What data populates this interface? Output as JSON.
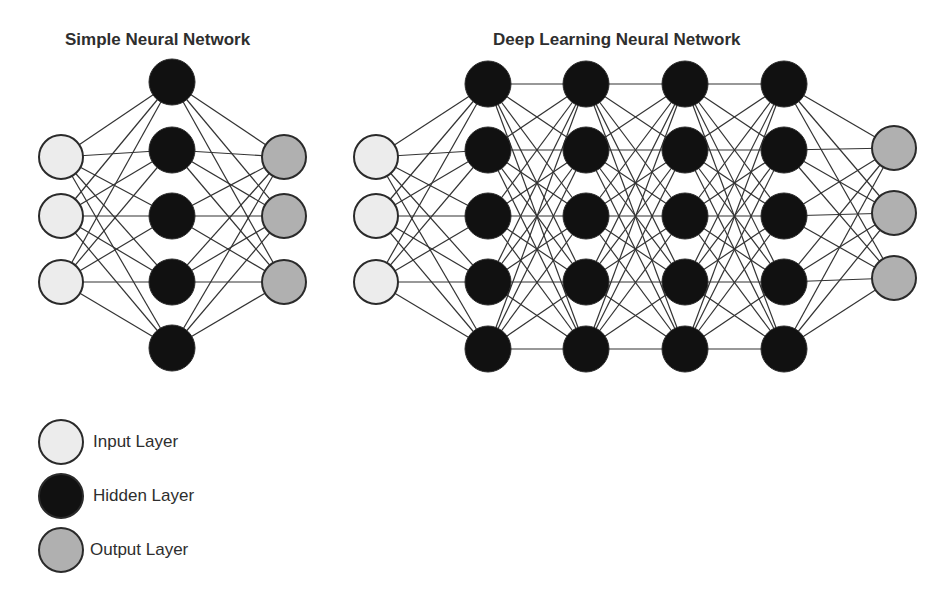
{
  "colors": {
    "input": "#ececec",
    "hidden": "#111111",
    "output": "#b0b0b0",
    "stroke": "#2a2a2a",
    "edge": "#333333"
  },
  "simple_network": {
    "title": "Simple Neural Network",
    "layers": [
      {
        "type": "input",
        "x": 61,
        "ys": [
          157,
          216,
          282
        ]
      },
      {
        "type": "hidden",
        "x": 172,
        "ys": [
          82,
          150,
          216,
          282,
          348
        ]
      },
      {
        "type": "output",
        "x": 284,
        "ys": [
          157,
          216,
          282
        ]
      }
    ]
  },
  "deep_network": {
    "title": "Deep Learning Neural Network",
    "layers": [
      {
        "type": "input",
        "x": 376,
        "ys": [
          157,
          216,
          282
        ]
      },
      {
        "type": "hidden",
        "x": 488,
        "ys": [
          84,
          150,
          216,
          282,
          349
        ]
      },
      {
        "type": "hidden",
        "x": 586,
        "ys": [
          84,
          150,
          216,
          282,
          349
        ]
      },
      {
        "type": "hidden",
        "x": 685,
        "ys": [
          84,
          150,
          216,
          282,
          349
        ]
      },
      {
        "type": "hidden",
        "x": 784,
        "ys": [
          84,
          150,
          216,
          282,
          349
        ]
      },
      {
        "type": "output",
        "x": 894,
        "ys": [
          148,
          213,
          278
        ]
      }
    ]
  },
  "legend": {
    "items": [
      {
        "type": "input",
        "label": "Input Layer"
      },
      {
        "type": "hidden",
        "label": "Hidden Layer"
      },
      {
        "type": "output",
        "label": "Output Layer"
      }
    ]
  }
}
